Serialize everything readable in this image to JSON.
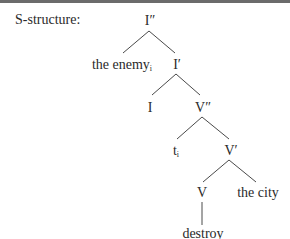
{
  "diagram": {
    "type": "syntax-tree",
    "label": "S-structure:",
    "nodes": {
      "root": {
        "text": "I″"
      },
      "spec_ip": {
        "text": "the enemy",
        "subscript": "i"
      },
      "i_bar": {
        "text": "I′"
      },
      "i_head": {
        "text": "I"
      },
      "v_dbl": {
        "text": "V″"
      },
      "trace": {
        "text": "t",
        "subscript": "i"
      },
      "v_bar": {
        "text": "V′"
      },
      "v_head": {
        "text": "V"
      },
      "object": {
        "text": "the city"
      },
      "verb": {
        "text": "destroy"
      }
    },
    "edges": [
      [
        "I″",
        "the enemy_i"
      ],
      [
        "I″",
        "I′"
      ],
      [
        "I′",
        "I"
      ],
      [
        "I′",
        "V″"
      ],
      [
        "V″",
        "t_i"
      ],
      [
        "V″",
        "V′"
      ],
      [
        "V′",
        "V"
      ],
      [
        "V′",
        "the city"
      ],
      [
        "V",
        "destroy"
      ]
    ],
    "colors": {
      "text": "#2a2a2a",
      "lines": "#4a4a4a",
      "top_border": "#6b6b6b"
    }
  }
}
